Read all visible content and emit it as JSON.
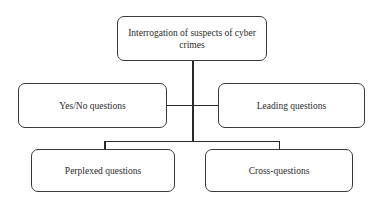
{
  "diagram": {
    "type": "hierarchy",
    "root": {
      "label": "Interrogation of suspects of cyber crimes"
    },
    "children": [
      {
        "label": "Yes/No questions"
      },
      {
        "label": "Leading questions"
      },
      {
        "label": "Perplexed questions"
      },
      {
        "label": "Cross-questions"
      }
    ],
    "colors": {
      "border": "#3a3a3a",
      "line": "#2a2a2a",
      "background": "#ffffff",
      "text": "#2a2a2a"
    }
  }
}
